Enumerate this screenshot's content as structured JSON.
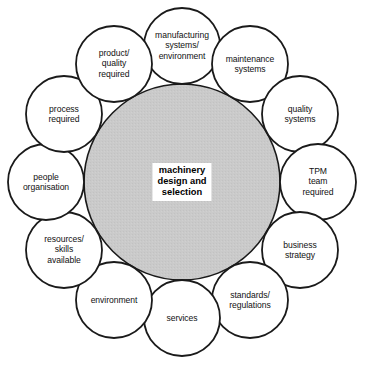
{
  "diagram": {
    "title": "machinery design and selection",
    "center": {
      "label": "machinery\ndesign and\nselection",
      "fill_color": "#c9c9c9",
      "stroke_color": "#1a1a1a",
      "cx": 182,
      "cy": 182,
      "r": 98
    },
    "layout": {
      "orbit_radius": 136,
      "satellite_radius": 38,
      "start_angle_deg": -90,
      "step_deg": 30,
      "count": 12
    },
    "satellite_style": {
      "fill_color": "#ffffff",
      "stroke_color": "#1a1a1a",
      "stroke_width": 1.8
    },
    "satellites": [
      {
        "id": "manufacturing-systems-environment",
        "label": "manufacturing\nsystems/\nenvironment",
        "cx": 182,
        "cy": 46
      },
      {
        "id": "maintenance-systems",
        "label": "maintenance\nsystems",
        "cx": 250,
        "cy": 64
      },
      {
        "id": "quality-systems",
        "label": "quality\nsystems",
        "cx": 300,
        "cy": 114
      },
      {
        "id": "tpm-team-required",
        "label": "TPM\nteam\nrequired",
        "cx": 318,
        "cy": 182
      },
      {
        "id": "business-strategy",
        "label": "business\nstrategy",
        "cx": 300,
        "cy": 250
      },
      {
        "id": "standards-regulations",
        "label": "standards/\nregulations",
        "cx": 250,
        "cy": 300
      },
      {
        "id": "services",
        "label": "services",
        "cx": 182,
        "cy": 318
      },
      {
        "id": "environment",
        "label": "environment",
        "cx": 114,
        "cy": 300
      },
      {
        "id": "resources-skills-available",
        "label": "resources/\nskills\navailable",
        "cx": 64,
        "cy": 250
      },
      {
        "id": "people-organisation",
        "label": "people\norganisation",
        "cx": 46,
        "cy": 182
      },
      {
        "id": "process-required",
        "label": "process\nrequired",
        "cx": 64,
        "cy": 114
      },
      {
        "id": "product-quality-required",
        "label": "product/\nquality\nrequired",
        "cx": 114,
        "cy": 64
      }
    ]
  }
}
